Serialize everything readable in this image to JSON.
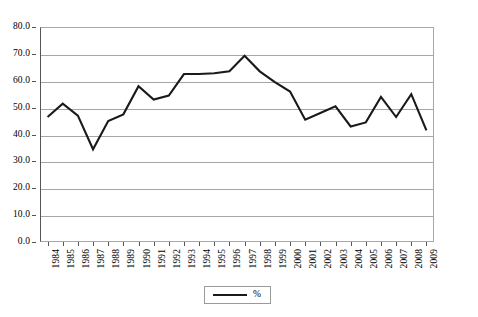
{
  "chart_data": {
    "type": "line",
    "title": "",
    "xlabel": "",
    "ylabel": "",
    "categories": [
      "1984",
      "1985",
      "1986",
      "1987",
      "1988",
      "1989",
      "1990",
      "1991",
      "1992",
      "1993",
      "1994",
      "1995",
      "1996",
      "1997",
      "1998",
      "1999",
      "2000",
      "2001",
      "2002",
      "2003",
      "2004",
      "2005",
      "2006",
      "2007",
      "2008",
      "2009"
    ],
    "series": [
      {
        "name": "%",
        "color": "#1a1a1a",
        "values": [
          46.5,
          51.5,
          47.0,
          34.5,
          45.0,
          47.5,
          58.0,
          53.0,
          54.5,
          62.5,
          62.5,
          62.8,
          63.5,
          69.3,
          63.5,
          59.5,
          56.0,
          45.5,
          48.0,
          50.5,
          43.0,
          44.5,
          54.0,
          46.5,
          55.0,
          41.5
        ]
      }
    ],
    "ylim": [
      0,
      80
    ],
    "ytick_step": 10,
    "y_ticks": [
      "0.0",
      "10.0",
      "20.0",
      "30.0",
      "40.0",
      "50.0",
      "60.0",
      "70.0",
      "80.0"
    ],
    "grid": true,
    "legend_position": "bottom-center"
  },
  "legend": {
    "entries": [
      {
        "label": "%"
      }
    ]
  },
  "caption": {
    "text": ""
  }
}
